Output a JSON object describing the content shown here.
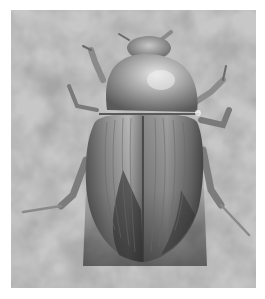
{
  "image": {
    "subject": "beetle",
    "description": "Grayscale photograph of a beetle viewed from above on a mottled gray background",
    "colors": {
      "background_light": "#b4b4b4",
      "background_dark": "#8c8c8c",
      "body_highlight": "#d8d8d8",
      "body_mid": "#8a8a8a",
      "body_dark": "#2e2e2e",
      "frame": "#ffffff"
    }
  }
}
